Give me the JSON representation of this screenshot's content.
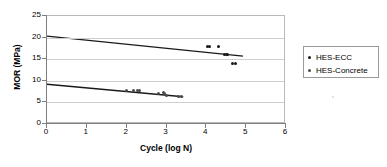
{
  "chart_data": {
    "type": "scatter",
    "title": "",
    "xlabel": "Cycle (log N)",
    "ylabel": "MOR (MPa)",
    "xlim": [
      0,
      6
    ],
    "ylim": [
      0,
      25
    ],
    "xticks": [
      "0",
      "1",
      "2",
      "3",
      "4",
      "5",
      "6"
    ],
    "yticks": [
      "0",
      "5",
      "10",
      "15",
      "20",
      "25"
    ],
    "grid": "horizontal",
    "legend_position": "right",
    "series": [
      {
        "name": "HES-ECC",
        "marker_color": "#1a1a1a",
        "points": [
          {
            "x": 4.03,
            "y": 18.0
          },
          {
            "x": 4.09,
            "y": 18.0
          },
          {
            "x": 4.31,
            "y": 18.0
          },
          {
            "x": 4.46,
            "y": 16.1
          },
          {
            "x": 4.5,
            "y": 16.1
          },
          {
            "x": 4.54,
            "y": 16.1
          },
          {
            "x": 4.66,
            "y": 14.1
          },
          {
            "x": 4.74,
            "y": 14.1
          }
        ],
        "trendline": {
          "x0": 0.0,
          "y0": 20.35,
          "x1": 4.92,
          "y1": 15.7
        }
      },
      {
        "name": "HES-Concrete",
        "marker_color": "#4a4a4a",
        "points": [
          {
            "x": 1.99,
            "y": 7.85
          },
          {
            "x": 2.17,
            "y": 7.8
          },
          {
            "x": 2.27,
            "y": 7.85
          },
          {
            "x": 2.33,
            "y": 7.8
          },
          {
            "x": 2.79,
            "y": 7.15
          },
          {
            "x": 2.93,
            "y": 7.2
          },
          {
            "x": 2.96,
            "y": 7.1
          },
          {
            "x": 3.0,
            "y": 6.6
          },
          {
            "x": 3.3,
            "y": 6.35
          },
          {
            "x": 3.38,
            "y": 6.35
          }
        ],
        "trendline": {
          "x0": 0.0,
          "y0": 9.2,
          "x1": 3.42,
          "y1": 6.3
        }
      }
    ]
  },
  "legend": {
    "entries": [
      {
        "label": "HES-ECC"
      },
      {
        "label": "HES-Concrete"
      }
    ]
  },
  "axes": {
    "x_title": "Cycle (log N)",
    "y_title": "MOR (MPa)"
  }
}
